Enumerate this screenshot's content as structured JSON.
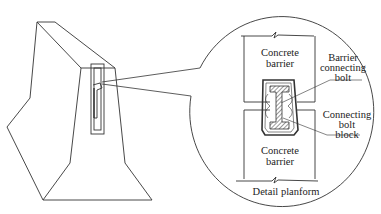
{
  "diagram": {
    "type": "engineering-detail",
    "stroke_color": "#333333",
    "background": "#ffffff",
    "labels": {
      "concrete_barrier_top": [
        "Concrete",
        "barrier"
      ],
      "concrete_barrier_bottom": [
        "Concrete",
        "barrier"
      ],
      "barrier_connecting_bolt": [
        "Barrier",
        "connecting",
        "bolt"
      ],
      "connecting_bolt_block": [
        "Connecting",
        "bolt",
        "block"
      ],
      "detail_caption": "Detail planform"
    }
  }
}
